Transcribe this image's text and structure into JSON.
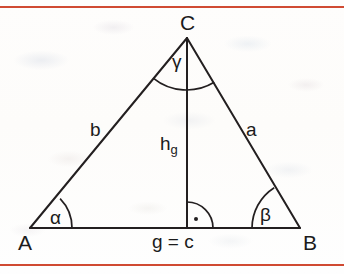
{
  "figure": {
    "kind": "euclidean-triangle-diagram",
    "stroke_color": "#231f20",
    "rule_color": "#d04a32",
    "background_color": "#fdfcfa",
    "vertices": [
      {
        "name": "A",
        "label": "A",
        "x": 30,
        "y": 228
      },
      {
        "name": "B",
        "label": "B",
        "x": 300,
        "y": 228
      },
      {
        "name": "C",
        "label": "C",
        "x": 187,
        "y": 38
      }
    ],
    "foot_of_altitude": {
      "name": "H",
      "x": 187,
      "y": 228
    },
    "sides": [
      {
        "name": "side-a",
        "label": "a",
        "from": "C",
        "to": "B"
      },
      {
        "name": "side-b",
        "label": "b",
        "from": "A",
        "to": "C"
      },
      {
        "name": "side-base",
        "label": "g = c",
        "from": "A",
        "to": "B"
      }
    ],
    "altitude": {
      "name": "height",
      "label_base": "h",
      "label_sub": "g",
      "from": "C",
      "to": "H"
    },
    "angles": [
      {
        "name": "angle-alpha",
        "label": "α",
        "at": "A"
      },
      {
        "name": "angle-beta",
        "label": "β",
        "at": "B"
      },
      {
        "name": "angle-gamma",
        "label": "γ",
        "at": "C"
      },
      {
        "name": "right-angle",
        "label": "",
        "at": "H",
        "marker": "quarter-arc-with-dot"
      }
    ],
    "labels": {
      "vertex_a": "A",
      "vertex_b": "B",
      "vertex_c": "C",
      "side_a": "a",
      "side_b": "b",
      "base": "g = c",
      "height_base": "h",
      "height_sub": "g",
      "alpha": "α",
      "beta": "β",
      "gamma": "γ"
    }
  }
}
